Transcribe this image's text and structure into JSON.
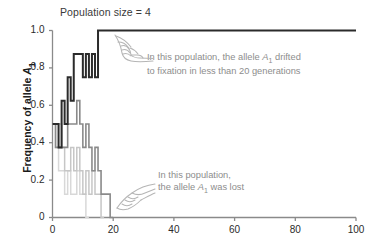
{
  "chart_data": {
    "type": "line",
    "title": "Population size = 4",
    "xlabel": "",
    "ylabel": "Frequency of allele A1",
    "ylabel_html": "Frequency of allele <i>A</i><sub>1</sub>",
    "xlim": [
      0,
      100
    ],
    "ylim": [
      0,
      1.0
    ],
    "xticks": [
      "0",
      "20",
      "40",
      "60",
      "80",
      "100"
    ],
    "xtick_values": [
      0,
      20,
      40,
      60,
      80,
      100
    ],
    "yticks": [
      "0",
      "0.2",
      "0.4",
      "0.6",
      "0.8",
      "1.0"
    ],
    "ytick_values": [
      0,
      0.2,
      0.4,
      0.6,
      0.8,
      1.0
    ],
    "grid": false,
    "legend": "none",
    "step_plot": true,
    "series": [
      {
        "name": "population-fixed",
        "color": "#2b2b2b",
        "width": 2.0,
        "x": [
          0,
          1,
          2,
          3,
          4,
          5,
          6,
          7,
          8,
          9,
          10,
          11,
          12,
          13,
          14,
          15,
          16,
          100
        ],
        "values": [
          0.5,
          0.5,
          0.375,
          0.625,
          0.5,
          0.75,
          0.625,
          0.875,
          0.875,
          0.875,
          0.75,
          0.875,
          0.75,
          0.875,
          0.75,
          1.0,
          1.0,
          1.0
        ]
      },
      {
        "name": "population-lost-late",
        "color": "#8a8a8a",
        "width": 1.6,
        "x": [
          0,
          1,
          2,
          3,
          4,
          5,
          6,
          7,
          8,
          9,
          10,
          11,
          12,
          13,
          14,
          15,
          16,
          17,
          18,
          19,
          20
        ],
        "values": [
          0.5,
          0.375,
          0.375,
          0.375,
          0.375,
          0.5,
          0.5,
          0.5,
          0.625,
          0.5,
          0.375,
          0.5,
          0.375,
          0.25,
          0.375,
          0.25,
          0.125,
          0.125,
          0.125,
          0.0,
          0.0
        ]
      },
      {
        "name": "population-lost-mid",
        "color": "#c6c6c6",
        "width": 1.5,
        "x": [
          0,
          1,
          2,
          3,
          4,
          5,
          6,
          7,
          8,
          9,
          10,
          11,
          12,
          13,
          14,
          15,
          16,
          17
        ],
        "values": [
          0.5,
          0.5,
          0.5,
          0.375,
          0.25,
          0.25,
          0.375,
          0.25,
          0.375,
          0.25,
          0.125,
          0.25,
          0.125,
          0.25,
          0.125,
          0.125,
          0.0,
          0.0
        ]
      },
      {
        "name": "population-lost-early",
        "color": "#d8d8d8",
        "width": 1.5,
        "x": [
          0,
          1,
          2,
          3,
          4,
          5,
          6,
          7,
          8,
          9,
          10,
          11,
          12
        ],
        "values": [
          0.5,
          0.375,
          0.25,
          0.25,
          0.125,
          0.25,
          0.125,
          0.125,
          0.25,
          0.125,
          0.125,
          0.0,
          0.0
        ]
      }
    ],
    "annotations": [
      {
        "name": "annotation-fixation",
        "line1_pre": "In this population, the allele ",
        "line1_italic": "A",
        "line1_sub": "1",
        "line1_post": " drifted",
        "line2": "to fixation in less than 20 generations"
      },
      {
        "name": "annotation-lost",
        "line1_pre": "In this population,",
        "line2_pre": "the allele ",
        "line2_italic": "A",
        "line2_sub": "1",
        "line2_post": " was lost"
      }
    ],
    "icons": [
      "pointing-hand-icon",
      "pointing-hand-icon"
    ],
    "colors": {
      "axis": "#8a8a8a",
      "text": "#2b2b2b",
      "annotation_text": "#8d8d8d",
      "background": "#ffffff"
    }
  }
}
